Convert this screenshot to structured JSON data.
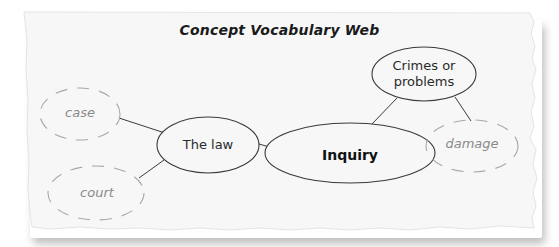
{
  "title": "Concept Vocabulary Web",
  "nodes": {
    "center": {
      "label": "Inquiry",
      "style": "solid-bold"
    },
    "law": {
      "label": "The law",
      "style": "solid"
    },
    "crimes": {
      "line1": "Crimes or",
      "line2": "problems",
      "style": "solid"
    },
    "case": {
      "label": "case",
      "style": "dashed"
    },
    "court": {
      "label": "court",
      "style": "dashed"
    },
    "damage": {
      "label": "damage",
      "style": "dashed"
    }
  },
  "edges": [
    [
      "The law",
      "Inquiry"
    ],
    [
      "Crimes or problems",
      "Inquiry"
    ],
    [
      "case",
      "The law"
    ],
    [
      "court",
      "The law"
    ],
    [
      "damage",
      "Crimes or problems"
    ]
  ],
  "colors": {
    "paper": "#f7f7f7",
    "solid_stroke": "#3a3a3a",
    "dashed_stroke": "#a8a8a8",
    "text_dark": "#1a1a1a",
    "text_faint": "#8a8a8a"
  }
}
